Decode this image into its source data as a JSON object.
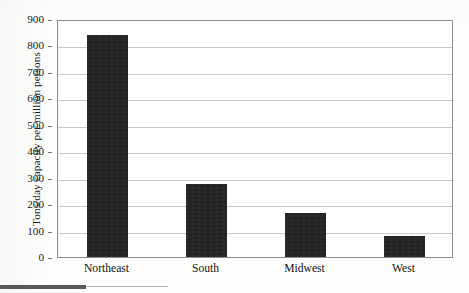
{
  "chart_data": {
    "type": "bar",
    "title": "",
    "xlabel": "",
    "ylabel": "Tons/day capacity per million persons",
    "categories": [
      "Northeast",
      "South",
      "Midwest",
      "West"
    ],
    "values": [
      840,
      275,
      165,
      80
    ],
    "ylim": [
      0,
      900
    ],
    "yticks": [
      0,
      100,
      200,
      300,
      400,
      500,
      600,
      700,
      800,
      900
    ],
    "ytick_labels": [
      "0",
      "100",
      "200",
      "300",
      "400",
      "500",
      "600",
      "700",
      "800",
      "900"
    ],
    "grid": true,
    "legend": null,
    "legend_position": "none",
    "bar_color": "#232323",
    "grid_color": "#c9c9c9",
    "axis_color": "#8d8d8d",
    "series": [
      {
        "name": "Tons/day capacity per million persons",
        "values": [
          840,
          275,
          165,
          80
        ]
      }
    ]
  },
  "axes": {
    "y_title": "Tons/day capacity per million persons",
    "y_ticks": [
      {
        "label": "900",
        "value": 900
      },
      {
        "label": "800",
        "value": 800
      },
      {
        "label": "700",
        "value": 700
      },
      {
        "label": "600",
        "value": 600
      },
      {
        "label": "500",
        "value": 500
      },
      {
        "label": "400",
        "value": 400
      },
      {
        "label": "300",
        "value": 300
      },
      {
        "label": "200",
        "value": 200
      },
      {
        "label": "100",
        "value": 100
      },
      {
        "label": "0",
        "value": 0
      }
    ],
    "x_ticks": [
      {
        "label": "Northeast"
      },
      {
        "label": "South"
      },
      {
        "label": "Midwest"
      },
      {
        "label": "West"
      }
    ]
  }
}
